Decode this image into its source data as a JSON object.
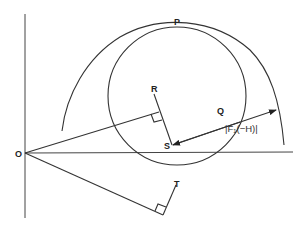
{
  "diagram": {
    "type": "geometric-vector-diagram",
    "colors": {
      "line": "#333333",
      "background": "#ffffff"
    },
    "points": {
      "O": {
        "label": "O"
      },
      "P": {
        "label": "P"
      },
      "Q": {
        "label": "Q"
      },
      "R": {
        "label": "R"
      },
      "S": {
        "label": "S"
      },
      "T": {
        "label": "T"
      }
    },
    "magnitude_label": "|F₁(−H)|",
    "elements": [
      "vertical-axis",
      "horizontal-axis",
      "small-circle",
      "large-arc",
      "line-O-to-RS-foot",
      "segment-R-S",
      "double-arrow-S-to-arc",
      "line-O-to-T-foot",
      "segment-T",
      "right-angle-markers"
    ]
  }
}
